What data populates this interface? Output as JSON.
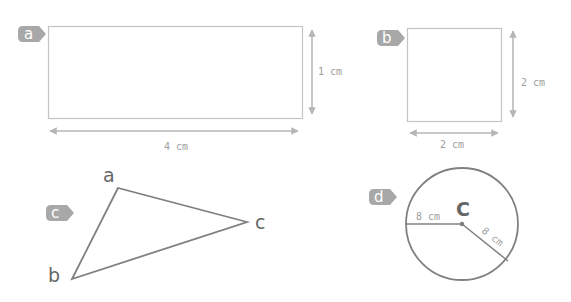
{
  "colors": {
    "light_stroke": "#c4c4c4",
    "arrow": "#b5b5b5",
    "dark_stroke": "#808080",
    "badge": "#a8a8a8",
    "text": "#9e9e9e",
    "vertex_text": "#666666"
  },
  "figures": {
    "a": {
      "badge": "a",
      "shape": "rectangle",
      "width_label": "4 cm",
      "height_label": "1 cm"
    },
    "b": {
      "badge": "b",
      "shape": "square",
      "width_label": "2 cm",
      "height_label": "2 cm"
    },
    "c": {
      "badge": "c",
      "shape": "triangle",
      "vertices": [
        "a",
        "b",
        "c"
      ]
    },
    "d": {
      "badge": "d",
      "shape": "circle",
      "center_label": "C",
      "radius_label_1": "8 cm",
      "radius_label_2": "8 cm"
    }
  }
}
